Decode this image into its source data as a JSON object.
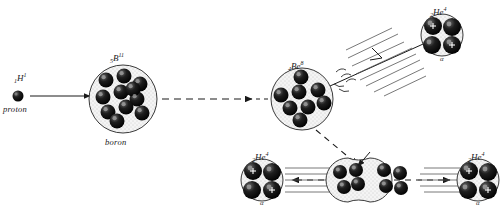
{
  "diagram": {
    "background": "#ffffff",
    "ink": "#1a1a1a",
    "nucleon_fill": "#111111",
    "nucleus_fill": "#f2f2f2"
  },
  "labels": {
    "proton_isotope_pre": "1",
    "proton_isotope_sym": "H",
    "proton_isotope_sup": "1",
    "proton_caption": "proton",
    "boron_isotope_pre": "5",
    "boron_isotope_sym": "B",
    "boron_isotope_sup": "11",
    "boron_caption": "boron",
    "beryllium_isotope_pre": "4",
    "beryllium_isotope_sym": "Be",
    "beryllium_isotope_sup": "8",
    "helium_isotope_pre": "2",
    "helium_isotope_sym": "He",
    "helium_isotope_sup": "4",
    "alpha_symbol": "α"
  },
  "stages": [
    {
      "name": "incoming-proton",
      "particle": "proton",
      "nucleon_count": 1,
      "position": {
        "x": 18,
        "y": 96
      }
    },
    {
      "name": "boron-11-nucleus",
      "particle": "boron",
      "nucleon_count": 11,
      "position": {
        "x": 123,
        "y": 99
      },
      "radius": 34
    },
    {
      "name": "beryllium-8-nucleus",
      "particle": "beryllium",
      "nucleon_count": 8,
      "position": {
        "x": 302,
        "y": 99
      },
      "radius": 31
    },
    {
      "name": "helium-4-top-right",
      "particle": "alpha",
      "nucleon_count": 4,
      "position": {
        "x": 442,
        "y": 35
      },
      "radius": 21
    },
    {
      "name": "beryllium-8-splitting",
      "particle": "beryllium-fission",
      "nucleon_count": 8,
      "position": {
        "x": 370,
        "y": 180
      },
      "radius": 22
    },
    {
      "name": "helium-4-bottom-left",
      "particle": "alpha",
      "nucleon_count": 4,
      "position": {
        "x": 262,
        "y": 180
      },
      "radius": 21
    },
    {
      "name": "helium-4-bottom-right",
      "particle": "alpha",
      "nucleon_count": 4,
      "position": {
        "x": 478,
        "y": 180
      },
      "radius": 21
    }
  ],
  "arrows": [
    {
      "name": "proton-to-boron",
      "style": "solid",
      "from": [
        30,
        96
      ],
      "to": [
        92,
        96
      ]
    },
    {
      "name": "boron-to-beryllium",
      "style": "dashed",
      "from": [
        160,
        99
      ],
      "to": [
        266,
        99
      ]
    },
    {
      "name": "beryllium-to-fission",
      "style": "dashed",
      "from": [
        318,
        131
      ],
      "to": [
        358,
        164
      ]
    },
    {
      "name": "fission-to-left-alpha",
      "style": "dashed",
      "from": [
        344,
        180
      ],
      "to": [
        290,
        180
      ]
    },
    {
      "name": "fission-to-right-alpha",
      "style": "dashed",
      "from": [
        396,
        180
      ],
      "to": [
        452,
        180
      ]
    },
    {
      "name": "alpha-ejection-track",
      "style": "solid",
      "from": [
        334,
        84
      ],
      "to": [
        424,
        44
      ]
    }
  ]
}
